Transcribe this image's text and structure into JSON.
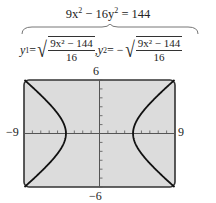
{
  "equation": {
    "main_prefix": "9x",
    "main_mid": " − 16y",
    "main_suffix": " = 144",
    "exp": "2",
    "y1_label": "y",
    "y1_sub": "1",
    "y2_label": "y",
    "y2_sub": "2",
    "equals": " = ",
    "equals_neg": " = − ",
    "comma": ",  ",
    "numerator": "9x² − 144",
    "denominator": "16"
  },
  "chart_data": {
    "type": "line",
    "functions": [
      "y1 = sqrt((9x^2 - 144)/16)",
      "y2 = -sqrt((9x^2 - 144)/16)"
    ],
    "xlim": [
      -9,
      9
    ],
    "ylim": [
      -6,
      6
    ],
    "xtick_step": 1,
    "ytick_step": 1,
    "grid": false,
    "vertices": [
      [
        -4,
        0
      ],
      [
        4,
        0
      ]
    ]
  },
  "axis_labels": {
    "xmin": "−9",
    "xmax": "9",
    "ymin": "−6",
    "ymax": "6"
  }
}
